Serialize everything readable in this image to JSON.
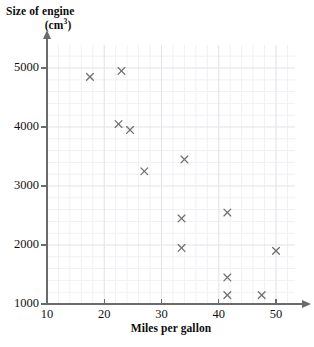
{
  "chart_data": {
    "type": "scatter",
    "title": "",
    "ylabel": "Size of engine (cm3)",
    "ylabel_line1": "Size of engine",
    "ylabel_line2_pre": "(cm",
    "ylabel_line2_sup": "3",
    "ylabel_line2_post": ")",
    "xlabel": "Miles per gallon",
    "xlim": [
      10,
      55
    ],
    "ylim": [
      1000,
      5300
    ],
    "xticks": [
      10,
      20,
      30,
      40,
      50
    ],
    "yticks": [
      1000,
      2000,
      3000,
      4000,
      5000
    ],
    "xtick_labels": [
      "10",
      "20",
      "30",
      "40",
      "50"
    ],
    "ytick_labels": [
      "1000",
      "2000",
      "3000",
      "4000",
      "5000"
    ],
    "grid": true,
    "grid_major_color": "#e3e3e9",
    "grid_minor_color": "#f1f1f5",
    "grid_minor_step_x": 2,
    "grid_minor_step_y": 200,
    "marker": "x",
    "marker_color": "#6e6e6e",
    "axis_color": "#6b6b6b",
    "legend": "none",
    "points": [
      {
        "x": 17.5,
        "y": 4850
      },
      {
        "x": 23.0,
        "y": 4950
      },
      {
        "x": 22.5,
        "y": 4050
      },
      {
        "x": 24.5,
        "y": 3950
      },
      {
        "x": 27.0,
        "y": 3250
      },
      {
        "x": 34.0,
        "y": 3450
      },
      {
        "x": 33.5,
        "y": 2450
      },
      {
        "x": 33.5,
        "y": 1950
      },
      {
        "x": 41.5,
        "y": 2550
      },
      {
        "x": 41.5,
        "y": 1450
      },
      {
        "x": 41.5,
        "y": 1150
      },
      {
        "x": 47.5,
        "y": 1150
      },
      {
        "x": 50.0,
        "y": 1900
      }
    ]
  }
}
